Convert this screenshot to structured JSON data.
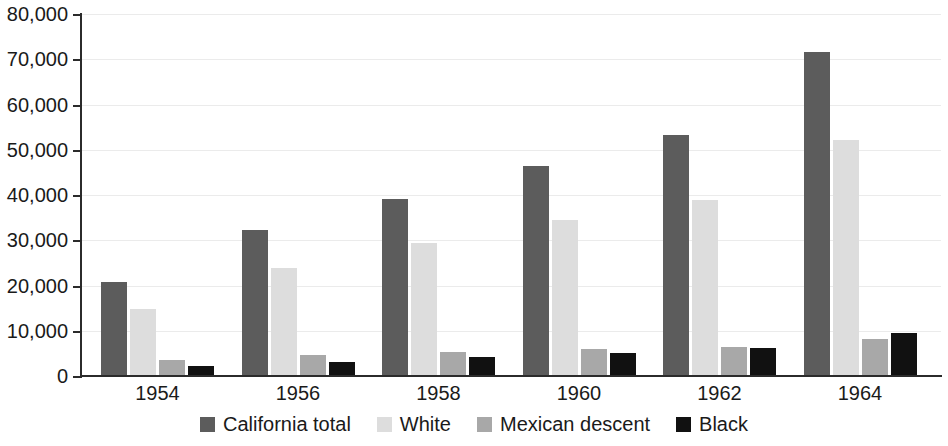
{
  "chart_data": {
    "type": "bar",
    "title": "",
    "subtitle": "",
    "xlabel": "",
    "ylabel": "",
    "categories": [
      "1954",
      "1956",
      "1958",
      "1960",
      "1962",
      "1964"
    ],
    "series": [
      {
        "name": "California total",
        "color": "#5c5c5c",
        "values": [
          20800,
          32300,
          39100,
          46400,
          53300,
          71600
        ]
      },
      {
        "name": "White",
        "color": "#dddddd",
        "values": [
          14900,
          23900,
          29300,
          34400,
          38900,
          52100
        ]
      },
      {
        "name": "Mexican descent",
        "color": "#a8a8a8",
        "values": [
          3500,
          4700,
          5300,
          6000,
          6500,
          8200
        ]
      },
      {
        "name": "Black",
        "color": "#111111",
        "values": [
          2200,
          3000,
          4100,
          5100,
          6200,
          9500
        ]
      }
    ],
    "ylim": [
      0,
      80000
    ],
    "ytick_values": [
      0,
      10000,
      20000,
      30000,
      40000,
      50000,
      60000,
      70000,
      80000
    ],
    "ytick_labels": [
      "0",
      "10,000",
      "20,000",
      "30,000",
      "40,000",
      "50,000",
      "60,000",
      "70,000",
      "80,000"
    ],
    "grid": true,
    "grid_axis": "y",
    "legend_position": "bottom",
    "annotations": []
  },
  "legend": {
    "items": [
      {
        "label": "California total",
        "swatch": "legend-swatch-california-total"
      },
      {
        "label": "White",
        "swatch": "legend-swatch-white"
      },
      {
        "label": "Mexican descent",
        "swatch": "legend-swatch-mexican-descent"
      },
      {
        "label": "Black",
        "swatch": "legend-swatch-black"
      }
    ]
  }
}
